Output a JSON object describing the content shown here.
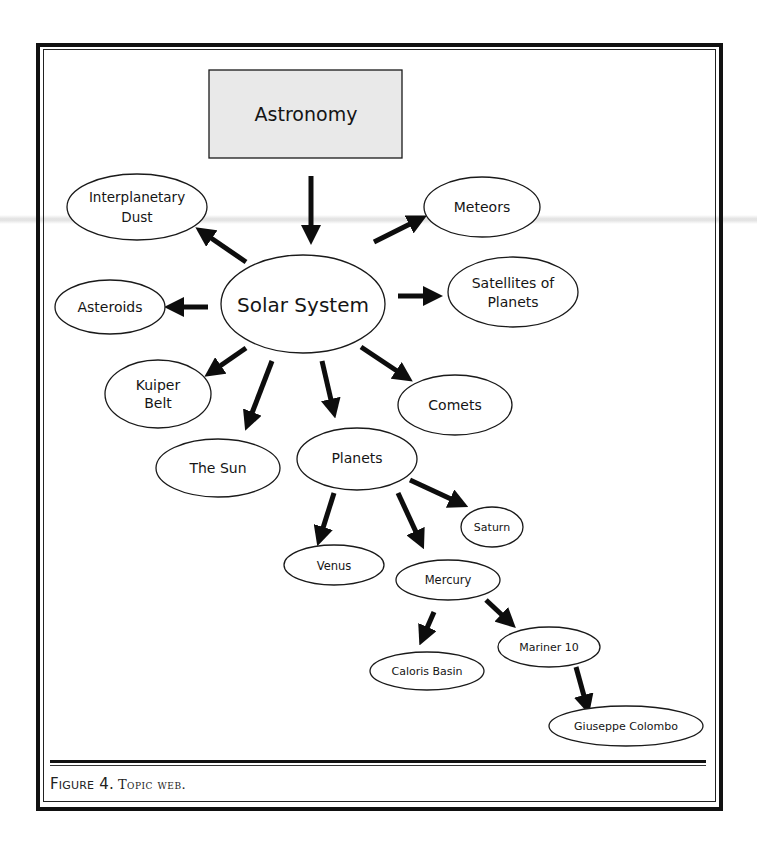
{
  "figure": {
    "label": "Figure 4.",
    "title": "Topic web."
  },
  "web": {
    "root": {
      "label": "Astronomy",
      "fill": "#e9e9e9"
    },
    "hub": {
      "label": "Solar System"
    },
    "nodes": [
      {
        "id": "interplanetary-dust",
        "label_line1": "Interplanetary",
        "label_line2": "Dust"
      },
      {
        "id": "meteors",
        "label": "Meteors"
      },
      {
        "id": "asteroids",
        "label": "Asteroids"
      },
      {
        "id": "satellites-of-planets",
        "label_line1": "Satellites of",
        "label_line2": "Planets"
      },
      {
        "id": "kuiper-belt",
        "label_line1": "Kuiper",
        "label_line2": "Belt"
      },
      {
        "id": "comets",
        "label": "Comets"
      },
      {
        "id": "the-sun",
        "label": "The Sun"
      },
      {
        "id": "planets",
        "label": "Planets"
      },
      {
        "id": "saturn",
        "label": "Saturn"
      },
      {
        "id": "venus",
        "label": "Venus"
      },
      {
        "id": "mercury",
        "label": "Mercury"
      },
      {
        "id": "caloris-basin",
        "label": "Caloris Basin"
      },
      {
        "id": "mariner-10",
        "label": "Mariner 10"
      },
      {
        "id": "giuseppe-colombo",
        "label": "Giuseppe Colombo"
      }
    ],
    "edges": [
      {
        "from": "Astronomy",
        "to": "Solar System"
      },
      {
        "from": "Solar System",
        "to": "Interplanetary Dust"
      },
      {
        "from": "Solar System",
        "to": "Meteors"
      },
      {
        "from": "Solar System",
        "to": "Asteroids"
      },
      {
        "from": "Solar System",
        "to": "Satellites of Planets"
      },
      {
        "from": "Solar System",
        "to": "Kuiper Belt"
      },
      {
        "from": "Solar System",
        "to": "The Sun"
      },
      {
        "from": "Solar System",
        "to": "Planets"
      },
      {
        "from": "Solar System",
        "to": "Comets"
      },
      {
        "from": "Planets",
        "to": "Venus"
      },
      {
        "from": "Planets",
        "to": "Mercury"
      },
      {
        "from": "Planets",
        "to": "Saturn"
      },
      {
        "from": "Mercury",
        "to": "Caloris Basin"
      },
      {
        "from": "Mercury",
        "to": "Mariner 10"
      },
      {
        "from": "Mariner 10",
        "to": "Giuseppe Colombo"
      }
    ]
  }
}
